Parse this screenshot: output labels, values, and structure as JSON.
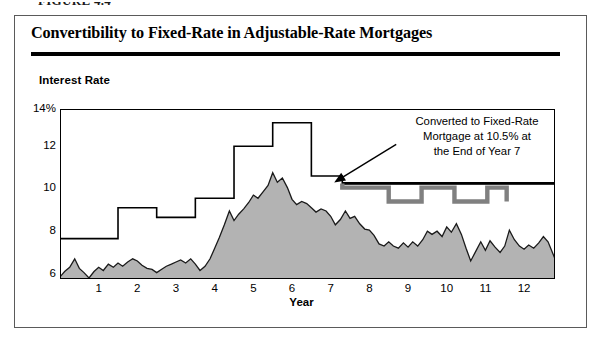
{
  "figure": {
    "caption": "FIGURE 4.4",
    "title": "Convertibility to Fixed-Rate in Adjustable-Rate Mortgages"
  },
  "axes": {
    "y_title": "Interest Rate",
    "x_title": "Year",
    "y_ticks": [
      "14%",
      "12",
      "10",
      "8",
      "6"
    ],
    "x_ticks": [
      "1",
      "2",
      "3",
      "4",
      "5",
      "6",
      "7",
      "8",
      "9",
      "10",
      "11",
      "12"
    ]
  },
  "annotation": {
    "line1": "Converted to Fixed-Rate",
    "line2": "Mortgage at 10.5% at",
    "line3": "the End of Year 7"
  },
  "colors": {
    "area_fill": "#b3b3b3",
    "area_stroke": "#1a1a1a",
    "cap_line": "#000000",
    "fixed_rate_line": "#000000",
    "would_be_cap_line": "#808080",
    "frame": "#000000"
  },
  "chart_data": {
    "type": "area",
    "title": "Convertibility to Fixed-Rate in Adjustable-Rate Mortgages",
    "xlabel": "Year",
    "ylabel": "Interest Rate",
    "xlim": [
      0,
      12.8
    ],
    "ylim": [
      6,
      14
    ],
    "grid": false,
    "legend": null,
    "y_tick_values": [
      6,
      8,
      10,
      12,
      14
    ],
    "x_tick_values": [
      1,
      2,
      3,
      4,
      5,
      6,
      7,
      8,
      9,
      10,
      11,
      12
    ],
    "annotations": [
      {
        "text": "Converted to Fixed-Rate Mortgage at 10.5% at the End of Year 7",
        "points_to_x": 7.0,
        "points_to_y": 10.5
      }
    ],
    "series": [
      {
        "name": "Index Rate (ARM underlying index)",
        "type": "area",
        "fill": "#b3b3b3",
        "x": [
          0.0,
          0.12,
          0.25,
          0.38,
          0.5,
          0.62,
          0.75,
          0.88,
          1.0,
          1.12,
          1.25,
          1.38,
          1.5,
          1.62,
          1.75,
          1.88,
          2.0,
          2.12,
          2.25,
          2.38,
          2.5,
          2.62,
          2.75,
          2.88,
          3.0,
          3.12,
          3.25,
          3.38,
          3.5,
          3.62,
          3.75,
          3.88,
          4.0,
          4.12,
          4.25,
          4.38,
          4.5,
          4.62,
          4.75,
          4.88,
          5.0,
          5.12,
          5.25,
          5.38,
          5.5,
          5.62,
          5.75,
          5.88,
          6.0,
          6.12,
          6.25,
          6.38,
          6.5,
          6.62,
          6.75,
          6.88,
          7.0,
          7.12,
          7.25,
          7.38,
          7.5,
          7.62,
          7.75,
          7.88,
          8.0,
          8.12,
          8.25,
          8.38,
          8.5,
          8.62,
          8.75,
          8.88,
          9.0,
          9.12,
          9.25,
          9.38,
          9.5,
          9.62,
          9.75,
          9.88,
          10.0,
          10.12,
          10.25,
          10.38,
          10.5,
          10.62,
          10.75,
          10.88,
          11.0,
          11.12,
          11.25,
          11.38,
          11.5,
          11.62,
          11.75,
          11.88,
          12.0,
          12.12,
          12.25,
          12.38,
          12.5,
          12.62,
          12.8
        ],
        "y": [
          6.1,
          6.35,
          6.55,
          6.95,
          6.5,
          6.3,
          6.05,
          6.35,
          6.55,
          6.4,
          6.7,
          6.55,
          6.75,
          6.6,
          6.8,
          6.95,
          6.85,
          6.65,
          6.5,
          6.45,
          6.3,
          6.45,
          6.6,
          6.7,
          6.8,
          6.9,
          6.75,
          6.95,
          6.7,
          6.4,
          6.6,
          6.95,
          7.45,
          7.95,
          8.55,
          9.2,
          8.75,
          9.05,
          9.3,
          9.6,
          9.95,
          9.8,
          10.1,
          10.4,
          11.0,
          10.55,
          10.75,
          10.3,
          9.75,
          9.5,
          9.65,
          9.55,
          9.35,
          9.15,
          9.3,
          9.2,
          8.95,
          8.55,
          8.8,
          9.2,
          8.85,
          8.95,
          8.6,
          8.35,
          8.3,
          8.05,
          7.65,
          7.55,
          7.75,
          7.55,
          7.45,
          7.7,
          7.5,
          7.75,
          7.55,
          7.85,
          8.25,
          8.1,
          8.25,
          8.0,
          8.45,
          8.2,
          8.6,
          8.1,
          7.45,
          6.85,
          7.3,
          7.75,
          7.35,
          7.8,
          7.5,
          7.25,
          7.55,
          8.3,
          7.85,
          7.55,
          7.4,
          7.6,
          7.45,
          7.7,
          8.0,
          7.75,
          6.95
        ]
      },
      {
        "name": "ARM Rate Cap (annual adjustment ceiling)",
        "type": "step",
        "stroke": "#000000",
        "x_breaks": [
          0.0,
          1.5,
          2.5,
          3.5,
          4.5,
          5.5,
          6.5,
          7.3
        ],
        "values": [
          7.9,
          9.35,
          8.9,
          9.8,
          12.25,
          13.35,
          10.85,
          10.5
        ]
      },
      {
        "name": "Fixed Rate After Conversion",
        "type": "line",
        "stroke": "#000000",
        "x": [
          7.3,
          12.8
        ],
        "y": [
          10.5,
          10.5
        ]
      },
      {
        "name": "Cap Had ARM Not Been Converted",
        "type": "step",
        "stroke": "#808080",
        "x_breaks": [
          7.3,
          8.5,
          9.35,
          10.2,
          11.05,
          11.55
        ],
        "values": [
          10.3,
          9.65,
          10.3,
          9.65,
          10.3,
          9.65
        ]
      }
    ]
  }
}
